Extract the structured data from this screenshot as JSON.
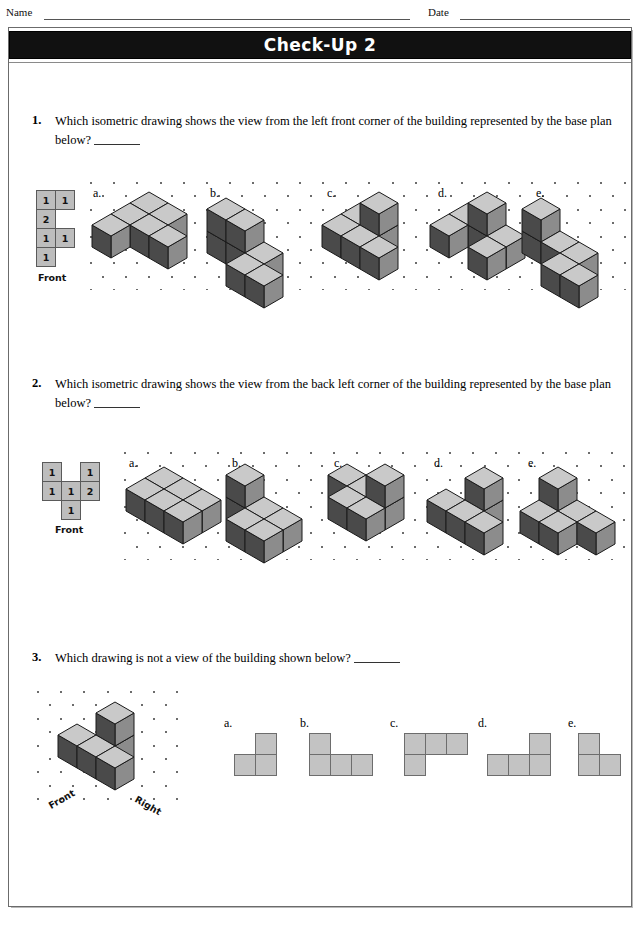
{
  "header": {
    "name_label": "Name",
    "date_label": "Date"
  },
  "title": "Check-Up 2",
  "questions": [
    {
      "number": "1.",
      "text": "Which isometric drawing shows the view from the left front corner of the building represented by the base plan below?",
      "front_label": "Front",
      "base_plan": {
        "rows": [
          [
            {
              "v": "1"
            },
            {
              "v": "1"
            }
          ],
          [
            {
              "v": "2"
            }
          ],
          [
            {
              "v": "1"
            },
            {
              "v": "1"
            }
          ],
          [
            {
              "v": "1"
            }
          ]
        ]
      },
      "options": [
        {
          "label": "a."
        },
        {
          "label": "b."
        },
        {
          "label": "c."
        },
        {
          "label": "d."
        },
        {
          "label": "e."
        }
      ]
    },
    {
      "number": "2.",
      "text": "Which isometric drawing shows the view from the back left corner of the building represented by the base plan below?",
      "front_label": "Front",
      "base_plan": {
        "rows": [
          [
            {
              "v": "1"
            },
            {
              "v": ""
            },
            {
              "v": "1"
            }
          ],
          [
            {
              "v": "1"
            },
            {
              "v": "1"
            },
            {
              "v": "2"
            }
          ],
          [
            {
              "v": ""
            },
            {
              "v": "1"
            },
            {
              "v": ""
            }
          ]
        ]
      },
      "options": [
        {
          "label": "a."
        },
        {
          "label": "b."
        },
        {
          "label": "c."
        },
        {
          "label": "d."
        },
        {
          "label": "e."
        }
      ]
    },
    {
      "number": "3.",
      "text": "Which drawing is not a view of the building shown below?",
      "front_label": "Front",
      "right_label": "Right",
      "options": [
        {
          "label": "a.",
          "cells": [
            [
              0,
              1
            ],
            [
              1,
              0
            ],
            [
              1,
              1
            ]
          ]
        },
        {
          "label": "b.",
          "cells": [
            [
              0,
              0
            ],
            [
              1,
              0
            ],
            [
              1,
              1
            ],
            [
              1,
              2
            ]
          ]
        },
        {
          "label": "c.",
          "cells": [
            [
              0,
              0
            ],
            [
              0,
              1
            ],
            [
              0,
              2
            ],
            [
              1,
              0
            ]
          ]
        },
        {
          "label": "d.",
          "cells": [
            [
              0,
              2
            ],
            [
              1,
              0
            ],
            [
              1,
              1
            ],
            [
              1,
              2
            ]
          ]
        },
        {
          "label": "e.",
          "cells": [
            [
              0,
              0
            ],
            [
              1,
              0
            ],
            [
              1,
              1
            ]
          ]
        }
      ]
    }
  ],
  "colors": {
    "cube_top": "#c9c9c9",
    "cube_left": "#4a4a4a",
    "cube_right": "#8c8c8c",
    "cube_edge": "#1a1a1a",
    "plan_fill": "#bdbdbd",
    "flat_fill": "#c3c3c3",
    "title_bg": "#111111",
    "title_fg": "#ffffff"
  },
  "iso_scenes": {
    "q1": [
      {
        "cubes": [
          [
            0,
            0,
            0
          ],
          [
            1,
            0,
            0
          ],
          [
            0,
            1,
            0
          ],
          [
            1,
            1,
            0
          ],
          [
            2,
            1,
            0
          ],
          [
            0,
            2,
            0
          ]
        ]
      },
      {
        "cubes": [
          [
            0,
            0,
            0
          ],
          [
            1,
            0,
            0
          ],
          [
            2,
            0,
            0
          ],
          [
            0,
            0,
            1
          ],
          [
            1,
            0,
            1
          ],
          [
            2,
            1,
            0
          ],
          [
            3,
            1,
            0
          ]
        ]
      },
      {
        "cubes": [
          [
            0,
            0,
            0
          ],
          [
            1,
            0,
            0
          ],
          [
            1,
            0,
            1
          ],
          [
            1,
            1,
            0
          ],
          [
            2,
            1,
            0
          ],
          [
            0,
            1,
            0
          ]
        ]
      },
      {
        "cubes": [
          [
            0,
            0,
            0
          ],
          [
            1,
            0,
            0
          ],
          [
            1,
            0,
            1
          ],
          [
            2,
            0,
            0
          ],
          [
            2,
            1,
            0
          ],
          [
            0,
            1,
            0
          ]
        ]
      },
      {
        "cubes": [
          [
            0,
            0,
            0
          ],
          [
            0,
            0,
            1
          ],
          [
            1,
            0,
            0
          ],
          [
            2,
            0,
            0
          ],
          [
            2,
            1,
            0
          ],
          [
            3,
            1,
            0
          ]
        ]
      }
    ],
    "q2": [
      {
        "cubes": [
          [
            0,
            0,
            0
          ],
          [
            1,
            0,
            0
          ],
          [
            0,
            1,
            0
          ],
          [
            1,
            1,
            0
          ],
          [
            2,
            0,
            0
          ],
          [
            2,
            1,
            0
          ]
        ]
      },
      {
        "cubes": [
          [
            0,
            0,
            0
          ],
          [
            0,
            0,
            1
          ],
          [
            1,
            1,
            0
          ],
          [
            2,
            1,
            0
          ],
          [
            1,
            0,
            0
          ],
          [
            2,
            0,
            0
          ]
        ]
      },
      {
        "cubes": [
          [
            0,
            0,
            0
          ],
          [
            1,
            0,
            0
          ],
          [
            2,
            0,
            0
          ],
          [
            2,
            0,
            1
          ],
          [
            1,
            1,
            0
          ],
          [
            2,
            1,
            0
          ]
        ]
      },
      {
        "cubes": [
          [
            1,
            0,
            0
          ],
          [
            1,
            0,
            1
          ],
          [
            0,
            1,
            0
          ],
          [
            1,
            1,
            0
          ],
          [
            2,
            1,
            0
          ]
        ]
      },
      {
        "cubes": [
          [
            0,
            0,
            0
          ],
          [
            0,
            0,
            1
          ],
          [
            1,
            0,
            0
          ],
          [
            1,
            1,
            0
          ],
          [
            2,
            0,
            0
          ],
          [
            0,
            1,
            0
          ]
        ]
      }
    ],
    "q3": {
      "cubes": [
        [
          1,
          0,
          0
        ],
        [
          1,
          0,
          1
        ],
        [
          0,
          1,
          0
        ],
        [
          1,
          1,
          0
        ],
        [
          2,
          1,
          0
        ]
      ]
    }
  }
}
